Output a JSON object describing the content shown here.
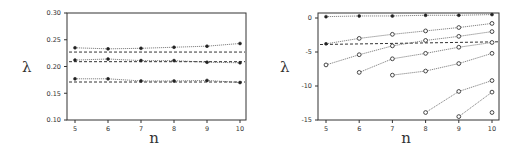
{
  "chart_data": [
    {
      "type": "line",
      "title": "",
      "xlabel": "n",
      "ylabel": "λ",
      "xlim": [
        5,
        10
      ],
      "ylim": [
        0.1,
        0.3
      ],
      "x_ticks": [
        5,
        6,
        7,
        8,
        9,
        10
      ],
      "x_tick_labels": [
        "5",
        "6",
        "7",
        "8",
        "9",
        "10"
      ],
      "y_ticks": [
        0.1,
        0.15,
        0.2,
        0.25,
        0.3
      ],
      "y_tick_labels": [
        "0.10",
        "0.15",
        "0.20",
        "0.25",
        "0.30"
      ],
      "grid": false,
      "legend": "none",
      "series": [
        {
          "name": "series-1",
          "marker": "filled",
          "x": [
            5,
            6,
            7,
            8,
            9,
            10
          ],
          "values": [
            0.235,
            0.233,
            0.234,
            0.236,
            0.238,
            0.243
          ]
        },
        {
          "name": "series-2",
          "marker": "filled",
          "x": [
            5,
            6,
            7,
            8,
            9,
            10
          ],
          "values": [
            0.212,
            0.214,
            0.211,
            0.211,
            0.208,
            0.207
          ]
        },
        {
          "name": "series-3",
          "marker": "filled",
          "x": [
            5,
            6,
            7,
            8,
            9,
            10
          ],
          "values": [
            0.177,
            0.177,
            0.173,
            0.173,
            0.174,
            0.17
          ]
        }
      ],
      "reference_lines": [
        {
          "name": "ref-1",
          "x": [
            5,
            10
          ],
          "values": [
            0.227,
            0.227
          ]
        },
        {
          "name": "ref-2",
          "x": [
            5,
            10
          ],
          "values": [
            0.209,
            0.209
          ]
        },
        {
          "name": "ref-3",
          "x": [
            5,
            10
          ],
          "values": [
            0.171,
            0.171
          ]
        }
      ]
    },
    {
      "type": "line",
      "title": "",
      "xlabel": "n",
      "ylabel": "λ",
      "xlim": [
        5,
        10
      ],
      "ylim": [
        -15,
        1
      ],
      "x_ticks": [
        5,
        6,
        7,
        8,
        9,
        10
      ],
      "x_tick_labels": [
        "5",
        "6",
        "7",
        "8",
        "9",
        "10"
      ],
      "y_ticks": [
        -15,
        -10,
        -5,
        0
      ],
      "y_tick_labels": [
        "-15",
        "-10",
        "-5",
        "0"
      ],
      "grid": false,
      "legend": "none",
      "series": [
        {
          "name": "series-1",
          "marker": "filled",
          "x": [
            5,
            6,
            7,
            8,
            9,
            10
          ],
          "values": [
            0.2,
            0.3,
            0.3,
            0.4,
            0.4,
            0.5
          ]
        },
        {
          "name": "series-2",
          "marker": "open",
          "first_marker": "filled",
          "x": [
            5,
            6,
            7,
            8,
            9,
            10
          ],
          "values": [
            -3.8,
            -3.0,
            -2.4,
            -1.9,
            -1.4,
            -0.8
          ]
        },
        {
          "name": "series-3",
          "marker": "open",
          "x": [
            5,
            6,
            7,
            8,
            9,
            10
          ],
          "values": [
            -6.9,
            -5.4,
            -4.1,
            -3.3,
            -2.7,
            -2.0
          ]
        },
        {
          "name": "series-4",
          "marker": "open",
          "x": [
            6,
            7,
            8,
            9,
            10
          ],
          "values": [
            -8.0,
            -6.0,
            -5.2,
            -4.3,
            -3.6
          ]
        },
        {
          "name": "series-5",
          "marker": "open",
          "x": [
            7,
            8,
            9,
            10
          ],
          "values": [
            -8.4,
            -7.8,
            -6.7,
            -5.2
          ]
        },
        {
          "name": "series-6",
          "marker": "open",
          "x": [
            8,
            9,
            10
          ],
          "values": [
            -13.9,
            -10.8,
            -9.2
          ]
        },
        {
          "name": "series-7",
          "marker": "open",
          "x": [
            9,
            10
          ],
          "values": [
            -14.5,
            -10.9
          ]
        },
        {
          "name": "series-8",
          "marker": "open",
          "x": [
            10
          ],
          "values": [
            -13.9
          ]
        }
      ],
      "reference_lines": [
        {
          "name": "ref-1",
          "x": [
            5,
            10
          ],
          "values": [
            -3.9,
            -3.5
          ]
        }
      ]
    }
  ]
}
